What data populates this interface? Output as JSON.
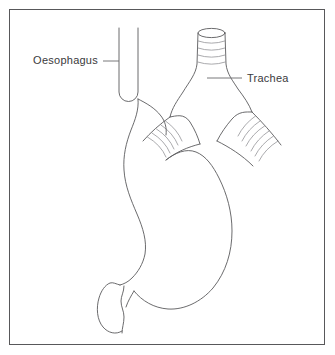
{
  "figure": {
    "background_color": "#ffffff",
    "frame_color": "#58585a",
    "outline_color": "#5a5a5c",
    "ring_color": "#8e8e91",
    "label_color": "#3a3a3c"
  },
  "labels": [
    {
      "id": "oesophagus",
      "text": "Oesophagus",
      "x": 98,
      "y": 64,
      "anchor": "end",
      "leader": {
        "x1": 103,
        "y1": 61,
        "x2": 119,
        "y2": 61
      }
    },
    {
      "id": "trachea",
      "text": "Trachea",
      "x": 247,
      "y": 82,
      "anchor": "start",
      "leader": {
        "x1": 207,
        "y1": 78,
        "x2": 242,
        "y2": 78
      }
    }
  ],
  "structures": [
    {
      "id": "oesophagus-tube",
      "name": "Oesophagus",
      "shape": "u-shaped-tube"
    },
    {
      "id": "trachea-tube",
      "name": "Trachea",
      "shape": "ringed-tube"
    },
    {
      "id": "left-bronchus",
      "name": "Left main bronchus",
      "shape": "ringed-branch"
    },
    {
      "id": "right-bronchus",
      "name": "Right main bronchus",
      "shape": "ringed-branch"
    },
    {
      "id": "stomach-body",
      "name": "Stomach",
      "shape": "curved-sac"
    },
    {
      "id": "duodenum",
      "name": "Duodenum",
      "shape": "bulb"
    }
  ]
}
